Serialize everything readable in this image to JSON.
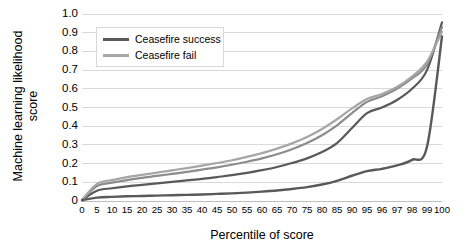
{
  "chart_data": {
    "type": "line",
    "title": "",
    "xlabel": "Percentile of score",
    "ylabel_line1": "Machine learning likelihood",
    "ylabel_line2": "score",
    "ylim": [
      0,
      1.0
    ],
    "yticks": [
      "1.0",
      "0.9",
      "0.8",
      "0.7",
      "0.6",
      "0.5",
      "0.4",
      "0.3",
      "0.2",
      "0.1",
      "0"
    ],
    "ytick_values": [
      1.0,
      0.9,
      0.8,
      0.7,
      0.6,
      0.5,
      0.4,
      0.3,
      0.2,
      0.1,
      0
    ],
    "xticks": [
      "0",
      "5",
      "10",
      "15",
      "20",
      "25",
      "30",
      "35",
      "40",
      "45",
      "50",
      "55",
      "60",
      "65",
      "70",
      "75",
      "80",
      "85",
      "90",
      "95",
      "96",
      "97",
      "98",
      "99",
      "100"
    ],
    "x_categories": [
      0,
      5,
      10,
      15,
      20,
      25,
      30,
      35,
      40,
      45,
      50,
      55,
      60,
      65,
      70,
      75,
      80,
      85,
      90,
      95,
      96,
      97,
      98,
      99,
      100
    ],
    "grid": "horizontal",
    "legend_position": "top-left",
    "legend": [
      {
        "label": "Ceasefire success",
        "color": "#595959"
      },
      {
        "label": "Ceasefire fail",
        "color": "#a6a6a6"
      }
    ],
    "series": [
      {
        "name": "Ceasefire success",
        "color": "#595959",
        "width": 2.2,
        "values": [
          0.005,
          0.055,
          0.068,
          0.078,
          0.086,
          0.094,
          0.102,
          0.11,
          0.118,
          0.128,
          0.138,
          0.15,
          0.165,
          0.182,
          0.203,
          0.228,
          0.262,
          0.31,
          0.39,
          0.47,
          0.5,
          0.54,
          0.6,
          0.7,
          0.955
        ]
      },
      {
        "name": "Ceasefire success (upper)",
        "color": "#8c8c8c",
        "width": 2.2,
        "values": [
          0.006,
          0.08,
          0.098,
          0.112,
          0.124,
          0.134,
          0.145,
          0.156,
          0.168,
          0.18,
          0.194,
          0.21,
          0.228,
          0.25,
          0.277,
          0.31,
          0.352,
          0.405,
          0.47,
          0.53,
          0.56,
          0.6,
          0.655,
          0.73,
          0.93
        ]
      },
      {
        "name": "Ceasefire fail (upper)",
        "color": "#a6a6a6",
        "width": 2.2,
        "values": [
          0.007,
          0.092,
          0.112,
          0.128,
          0.14,
          0.152,
          0.164,
          0.176,
          0.189,
          0.203,
          0.218,
          0.236,
          0.256,
          0.28,
          0.308,
          0.342,
          0.385,
          0.437,
          0.495,
          0.545,
          0.572,
          0.61,
          0.665,
          0.745,
          0.905
        ]
      },
      {
        "name": "Ceasefire fail",
        "color": "#595959",
        "width": 2.4,
        "values": [
          0.004,
          0.018,
          0.022,
          0.025,
          0.027,
          0.029,
          0.031,
          0.033,
          0.035,
          0.038,
          0.041,
          0.045,
          0.05,
          0.056,
          0.064,
          0.074,
          0.088,
          0.108,
          0.135,
          0.16,
          0.172,
          0.19,
          0.22,
          0.29,
          0.88
        ]
      }
    ]
  },
  "plot_geometry": {
    "left": 82,
    "right": 442,
    "top": 14,
    "bottom": 201
  }
}
